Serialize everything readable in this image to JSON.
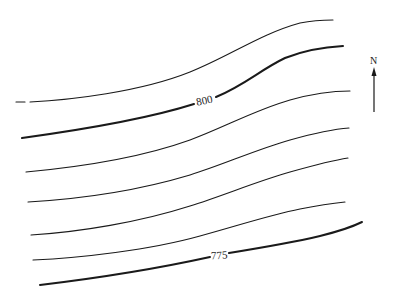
{
  "map": {
    "type": "topographic-contour-map",
    "contour_labels": {
      "upper_index": "800",
      "lower_index": "775"
    },
    "north_arrow": {
      "label": "N"
    },
    "contours": [
      {
        "id": 1,
        "style": "thin"
      },
      {
        "id": 2,
        "style": "index",
        "label": "800"
      },
      {
        "id": 3,
        "style": "thin"
      },
      {
        "id": 4,
        "style": "thin"
      },
      {
        "id": 5,
        "style": "thin"
      },
      {
        "id": 6,
        "style": "thin"
      },
      {
        "id": 7,
        "style": "index",
        "label": "775"
      }
    ],
    "colors": {
      "line": "#1a1a1a",
      "background": "#ffffff"
    }
  }
}
